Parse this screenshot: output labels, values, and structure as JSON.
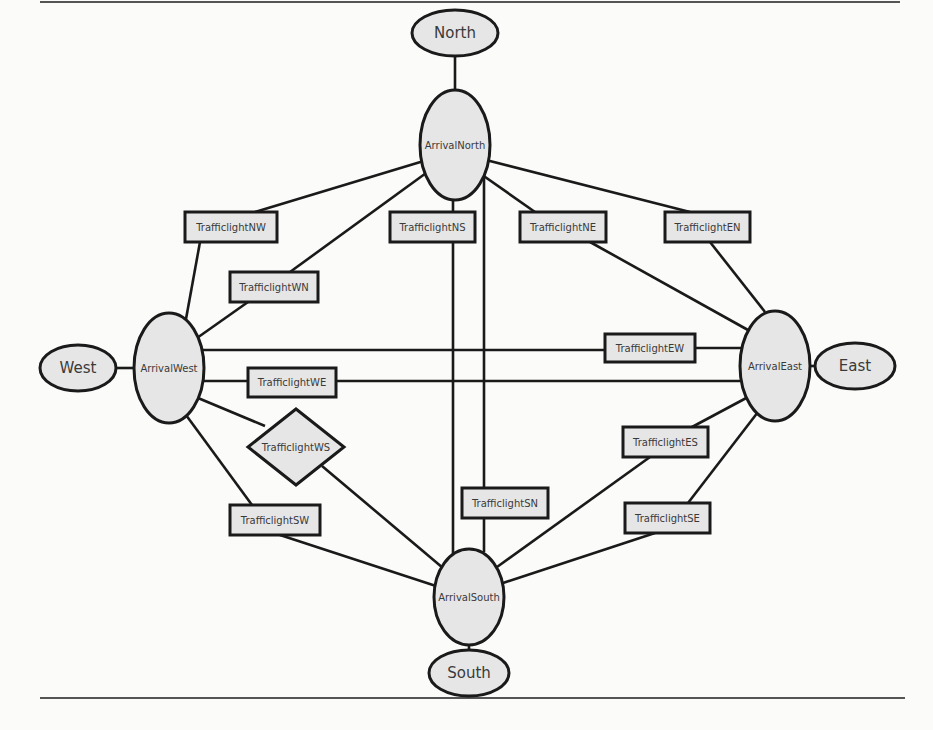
{
  "diagram": {
    "type": "graph",
    "rules": [
      {
        "x1": 40,
        "y1": 2,
        "x2": 900,
        "y2": 2
      },
      {
        "x1": 40,
        "y1": 698,
        "x2": 905,
        "y2": 698
      }
    ],
    "nodes": [
      {
        "id": "north",
        "label": "North",
        "shape": "ellipse",
        "cx": 455,
        "cy": 33,
        "rx": 43,
        "ry": 23,
        "font": 15
      },
      {
        "id": "arrival_north",
        "label": "ArrivalNorth",
        "shape": "ellipse",
        "cx": 455,
        "cy": 145,
        "rx": 35,
        "ry": 55,
        "font": 10
      },
      {
        "id": "west",
        "label": "West",
        "shape": "ellipse",
        "cx": 78,
        "cy": 368,
        "rx": 38,
        "ry": 23,
        "font": 15
      },
      {
        "id": "arrival_west",
        "label": "ArrivalWest",
        "shape": "ellipse",
        "cx": 169,
        "cy": 368,
        "rx": 35,
        "ry": 55,
        "font": 10
      },
      {
        "id": "arrival_east",
        "label": "ArrivalEast",
        "shape": "ellipse",
        "cx": 775,
        "cy": 366,
        "rx": 35,
        "ry": 55,
        "font": 10
      },
      {
        "id": "east",
        "label": "East",
        "shape": "ellipse",
        "cx": 855,
        "cy": 366,
        "rx": 40,
        "ry": 23,
        "font": 15
      },
      {
        "id": "arrival_south",
        "label": "ArrivalSouth",
        "shape": "ellipse",
        "cx": 469,
        "cy": 597,
        "rx": 35,
        "ry": 48,
        "font": 10
      },
      {
        "id": "south",
        "label": "South",
        "shape": "ellipse",
        "cx": 469,
        "cy": 673,
        "rx": 40,
        "ry": 23,
        "font": 15
      },
      {
        "id": "tl_nw",
        "label": "TrafficlightNW",
        "shape": "rect",
        "x": 185,
        "y": 212,
        "w": 92,
        "h": 30,
        "font": 10
      },
      {
        "id": "tl_ns",
        "label": "TrafficlightNS",
        "shape": "rect",
        "x": 390,
        "y": 212,
        "w": 85,
        "h": 30,
        "font": 10
      },
      {
        "id": "tl_ne",
        "label": "TrafficlightNE",
        "shape": "rect",
        "x": 520,
        "y": 212,
        "w": 86,
        "h": 30,
        "font": 10
      },
      {
        "id": "tl_en",
        "label": "TrafficlightEN",
        "shape": "rect",
        "x": 665,
        "y": 212,
        "w": 85,
        "h": 30,
        "font": 10
      },
      {
        "id": "tl_wn",
        "label": "TrafficlightWN",
        "shape": "rect",
        "x": 230,
        "y": 272,
        "w": 88,
        "h": 30,
        "font": 10
      },
      {
        "id": "tl_ew",
        "label": "TrafficlightEW",
        "shape": "rect",
        "x": 605,
        "y": 334,
        "w": 90,
        "h": 28,
        "font": 10
      },
      {
        "id": "tl_we",
        "label": "TrafficlightWE",
        "shape": "rect",
        "x": 248,
        "y": 368,
        "w": 88,
        "h": 29,
        "font": 10
      },
      {
        "id": "tl_ws",
        "label": "TrafficlightWS",
        "shape": "diamond",
        "cx": 296,
        "cy": 447,
        "hw": 48,
        "hh": 38,
        "font": 10
      },
      {
        "id": "tl_es",
        "label": "TrafficlightES",
        "shape": "rect",
        "x": 623,
        "y": 427,
        "w": 85,
        "h": 30,
        "font": 10
      },
      {
        "id": "tl_sn",
        "label": "TrafficlightSN",
        "shape": "rect",
        "x": 462,
        "y": 488,
        "w": 86,
        "h": 30,
        "font": 10
      },
      {
        "id": "tl_sw",
        "label": "TrafficlightSW",
        "shape": "rect",
        "x": 230,
        "y": 505,
        "w": 90,
        "h": 30,
        "font": 10
      },
      {
        "id": "tl_se",
        "label": "TrafficlightSE",
        "shape": "rect",
        "x": 625,
        "y": 503,
        "w": 85,
        "h": 30,
        "font": 10
      }
    ],
    "edges": [
      {
        "from": "north",
        "to": "arrival_north",
        "pts": [
          [
            455,
            56
          ],
          [
            455,
            90
          ]
        ]
      },
      {
        "from": "west",
        "to": "arrival_west",
        "pts": [
          [
            116,
            368
          ],
          [
            134,
            368
          ]
        ]
      },
      {
        "from": "arrival_east",
        "to": "east",
        "pts": [
          [
            810,
            366
          ],
          [
            815,
            366
          ]
        ]
      },
      {
        "from": "arrival_south",
        "to": "south",
        "pts": [
          [
            469,
            645
          ],
          [
            469,
            650
          ]
        ]
      },
      {
        "from": "arrival_north",
        "to": "tl_nw",
        "pts": [
          [
            427,
            160
          ],
          [
            255,
            212
          ]
        ]
      },
      {
        "from": "tl_nw",
        "to": "arrival_west",
        "pts": [
          [
            200,
            242
          ],
          [
            186,
            319
          ]
        ]
      },
      {
        "from": "arrival_north",
        "to": "tl_wn",
        "pts": [
          [
            433,
            168
          ],
          [
            290,
            272
          ]
        ]
      },
      {
        "from": "tl_wn",
        "to": "arrival_west",
        "pts": [
          [
            248,
            302
          ],
          [
            197,
            338
          ]
        ]
      },
      {
        "from": "arrival_north",
        "to": "tl_ns",
        "pts": [
          [
            453,
            199
          ],
          [
            453,
            212
          ]
        ]
      },
      {
        "from": "tl_ns",
        "to": "arrival_south",
        "pts": [
          [
            453,
            242
          ],
          [
            453,
            555
          ]
        ]
      },
      {
        "from": "arrival_north",
        "to": "tl_sn",
        "pts": [
          [
            484,
            175
          ],
          [
            484,
            488
          ]
        ]
      },
      {
        "from": "tl_sn",
        "to": "arrival_south",
        "pts": [
          [
            484,
            518
          ],
          [
            484,
            552
          ]
        ]
      },
      {
        "from": "arrival_north",
        "to": "tl_ne",
        "pts": [
          [
            478,
            172
          ],
          [
            535,
            212
          ]
        ]
      },
      {
        "from": "tl_ne",
        "to": "arrival_east",
        "pts": [
          [
            590,
            242
          ],
          [
            748,
            330
          ]
        ]
      },
      {
        "from": "arrival_north",
        "to": "tl_en",
        "pts": [
          [
            486,
            160
          ],
          [
            690,
            212
          ]
        ]
      },
      {
        "from": "tl_en",
        "to": "arrival_east",
        "pts": [
          [
            710,
            242
          ],
          [
            765,
            312
          ]
        ]
      },
      {
        "from": "arrival_west",
        "to": "tl_ew",
        "pts": [
          [
            203,
            350
          ],
          [
            605,
            350
          ]
        ]
      },
      {
        "from": "tl_ew",
        "to": "arrival_east",
        "pts": [
          [
            695,
            348
          ],
          [
            741,
            348
          ]
        ]
      },
      {
        "from": "arrival_west",
        "to": "tl_we",
        "pts": [
          [
            204,
            381
          ],
          [
            248,
            381
          ]
        ]
      },
      {
        "from": "tl_we",
        "to": "arrival_east",
        "pts": [
          [
            336,
            381
          ],
          [
            740,
            381
          ]
        ]
      },
      {
        "from": "arrival_west",
        "to": "tl_ws",
        "pts": [
          [
            198,
            398
          ],
          [
            265,
            426
          ]
        ]
      },
      {
        "from": "tl_ws",
        "to": "arrival_south",
        "pts": [
          [
            322,
            466
          ],
          [
            443,
            568
          ]
        ]
      },
      {
        "from": "arrival_west",
        "to": "tl_sw",
        "pts": [
          [
            186,
            415
          ],
          [
            252,
            505
          ]
        ]
      },
      {
        "from": "tl_sw",
        "to": "arrival_south",
        "pts": [
          [
            280,
            535
          ],
          [
            436,
            586
          ]
        ]
      },
      {
        "from": "arrival_east",
        "to": "tl_es",
        "pts": [
          [
            750,
            396
          ],
          [
            692,
            427
          ]
        ]
      },
      {
        "from": "tl_es",
        "to": "arrival_south",
        "pts": [
          [
            650,
            457
          ],
          [
            497,
            567
          ]
        ]
      },
      {
        "from": "arrival_east",
        "to": "tl_se",
        "pts": [
          [
            758,
            412
          ],
          [
            688,
            503
          ]
        ]
      },
      {
        "from": "tl_se",
        "to": "arrival_south",
        "pts": [
          [
            655,
            533
          ],
          [
            503,
            583
          ]
        ]
      }
    ]
  }
}
